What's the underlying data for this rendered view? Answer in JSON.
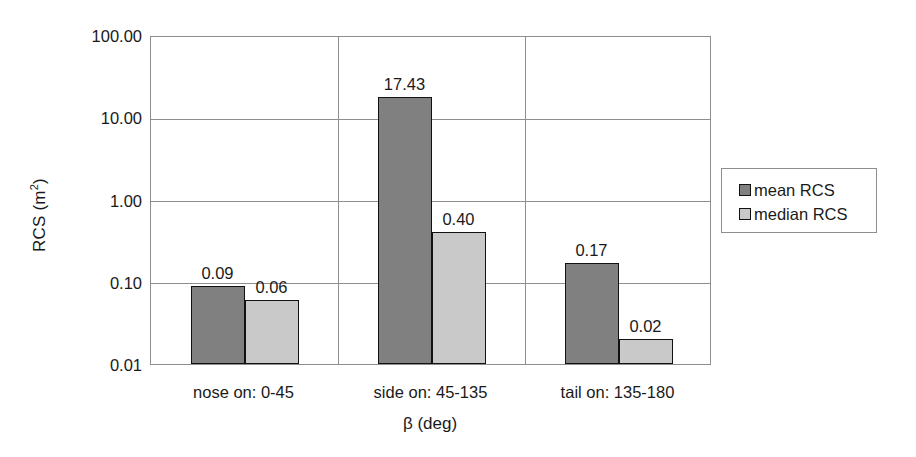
{
  "chart_data": {
    "type": "bar",
    "title": "",
    "xlabel": "β (deg)",
    "ylabel": "RCS (m²)",
    "ylabel_base": "RCS (m",
    "ylabel_sup": "2",
    "ylabel_tail": ")",
    "yscale": "log",
    "ylim": [
      0.01,
      100
    ],
    "ytick_labels": [
      "100.00",
      "10.00",
      "1.00",
      "0.10",
      "0.01"
    ],
    "ytick_values": [
      100,
      10,
      1,
      0.1,
      0.01
    ],
    "grid": true,
    "legend_position": "right",
    "categories": [
      "nose on:  0-45",
      "side on: 45-135",
      "tail on: 135-180"
    ],
    "series": [
      {
        "name": "mean RCS",
        "color": "#808080",
        "values": [
          0.09,
          17.43,
          0.17
        ],
        "labels": [
          "0.09",
          "17.43",
          "0.17"
        ]
      },
      {
        "name": "median RCS",
        "color": "#c9c9c9",
        "values": [
          0.06,
          0.4,
          0.02
        ],
        "labels": [
          "0.06",
          "0.40",
          "0.02"
        ]
      }
    ]
  },
  "legend": {
    "entries": [
      {
        "label": "mean RCS",
        "swatch": "#808080"
      },
      {
        "label": "median RCS",
        "swatch": "#c9c9c9"
      }
    ]
  },
  "axes": {
    "y_title_main": "RCS (m",
    "y_title_sup": "2",
    "y_title_end": ")",
    "x_title": "β (deg)"
  },
  "colors": {
    "mean_bar": "#808080",
    "median_bar": "#c9c9c9",
    "bar_border": "#111111",
    "gridline": "#8e8e8e",
    "text": "#1a1a1a",
    "background": "#ffffff"
  }
}
